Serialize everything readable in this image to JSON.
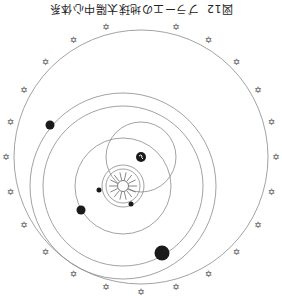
{
  "caption": {
    "figure_number": "図12",
    "title": "ブラーエの地球太陽中心体系",
    "orientation": "upside-down"
  },
  "diagram": {
    "type": "Tycho Brahe geo-heliocentric system",
    "earth": {
      "label": "earth",
      "cx": 141,
      "cy": 157,
      "r": 5,
      "color": "#1a1a1a"
    },
    "sun": {
      "label": "sun",
      "cx": 123,
      "cy": 186,
      "r": 10,
      "ray_length": 14
    },
    "stellar_sphere": {
      "cx": 141,
      "cy": 157,
      "r": 127
    },
    "sun_orbit_around_earth": {
      "cx": 141,
      "cy": 157,
      "r": 35
    },
    "orbits_around_sun": [
      {
        "name": "mercury-orbit",
        "r": 17
      },
      {
        "name": "venus-orbit",
        "r": 21
      },
      {
        "name": "mars-orbit",
        "r": 48
      },
      {
        "name": "jupiter-orbit",
        "r": 80
      },
      {
        "name": "saturn-orbit",
        "r": 93
      }
    ],
    "planets": [
      {
        "name": "mercury",
        "cx": 99,
        "cy": 190,
        "r": 2.5
      },
      {
        "name": "venus",
        "cx": 131,
        "cy": 204,
        "r": 2.5
      },
      {
        "name": "mars",
        "cx": 81,
        "cy": 210,
        "r": 4.5
      },
      {
        "name": "jupiter",
        "cx": 162,
        "cy": 253,
        "r": 7.5
      },
      {
        "name": "saturn",
        "cx": 50,
        "cy": 125,
        "r": 4.5
      }
    ],
    "star_symbol": "✡",
    "star_count": 24,
    "colors": {
      "line": "#8a8a8a",
      "planet": "#1a1a1a",
      "background": "#ffffff"
    }
  }
}
